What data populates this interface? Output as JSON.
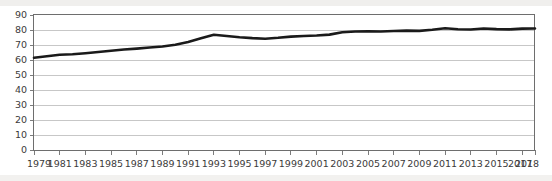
{
  "chart_data": {
    "type": "line",
    "title": "",
    "subtitle": "",
    "xlabel": "",
    "ylabel": "",
    "xlim": [
      1979,
      2018
    ],
    "ylim": [
      0,
      90
    ],
    "grid": true,
    "legend_position": "none",
    "line_color": "#1a1a1a",
    "grid_color": "#b9b9b9",
    "axis_color": "#6e6e6e",
    "y_ticks": [
      0,
      10,
      20,
      30,
      40,
      50,
      60,
      70,
      80,
      90
    ],
    "y_tick_labels": [
      "0",
      "10",
      "20",
      "30",
      "40",
      "50",
      "60",
      "70",
      "80",
      "90"
    ],
    "x_ticks": [
      1979,
      1981,
      1983,
      1985,
      1987,
      1989,
      1991,
      1993,
      1995,
      1997,
      1999,
      2001,
      2003,
      2005,
      2007,
      2009,
      2011,
      2013,
      2015,
      2017,
      2018
    ],
    "x_tick_labels": [
      "1979",
      "1981",
      "1983",
      "1985",
      "1987",
      "1989",
      "1991",
      "1993",
      "1995",
      "1997",
      "1999",
      "2001",
      "2003",
      "2005",
      "2007",
      "2009",
      "2011",
      "2013",
      "2015",
      "2017",
      "2018"
    ],
    "x": [
      1979,
      1980,
      1981,
      1982,
      1983,
      1984,
      1985,
      1986,
      1987,
      1988,
      1989,
      1990,
      1991,
      1992,
      1993,
      1994,
      1995,
      1996,
      1997,
      1998,
      1999,
      2000,
      2001,
      2002,
      2003,
      2004,
      2005,
      2006,
      2007,
      2008,
      2009,
      2010,
      2011,
      2012,
      2013,
      2014,
      2015,
      2016,
      2017,
      2018
    ],
    "series": [
      {
        "name": "value",
        "values": [
          61.5,
          62.5,
          63.5,
          63.8,
          64.5,
          65.3,
          66.2,
          67.0,
          67.6,
          68.3,
          69.0,
          70.2,
          72.0,
          74.5,
          76.8,
          76.0,
          75.2,
          74.6,
          74.2,
          74.8,
          75.6,
          76.0,
          76.3,
          76.9,
          78.5,
          79.0,
          79.2,
          79.0,
          79.3,
          79.6,
          79.4,
          80.2,
          81.2,
          80.5,
          80.3,
          81.0,
          80.6,
          80.4,
          80.9,
          81.0
        ]
      }
    ]
  }
}
